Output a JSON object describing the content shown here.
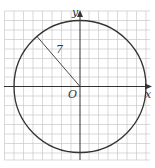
{
  "diagram": {
    "x_label": "x",
    "y_label": "y",
    "origin_label": "O",
    "radius_label": "7",
    "radius": 7,
    "grid_units": {
      "x_min": -7,
      "x_max": 7,
      "y_min": -7,
      "y_max": 7
    },
    "colors": {
      "grid": "#c8c8c8",
      "axis": "#333333",
      "circle": "#333333"
    }
  }
}
